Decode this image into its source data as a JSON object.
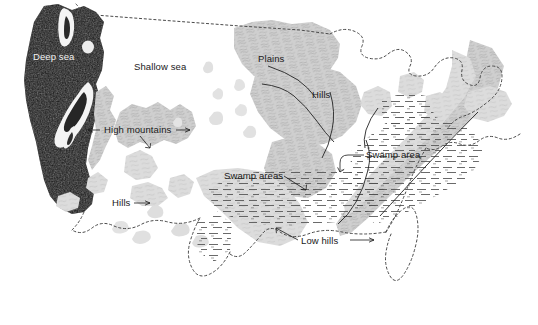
{
  "map": {
    "title": "Paleogeographic map of the United States",
    "width": 538,
    "height": 325,
    "background_color": "#ffffff",
    "colors": {
      "deep_sea": "#161616",
      "land_gray": "#c4c4c4",
      "land_gray_light": "#d8d8d8",
      "border_dotted": "#4a4a4a",
      "label_dark": "#1a1a1a",
      "label_light": "#f2f2f2",
      "swamp_dash": "#555555",
      "trendline": "#222222"
    },
    "labels": [
      {
        "id": "deep-sea",
        "text": "Deep sea",
        "x": 33,
        "y": 60,
        "style": "light",
        "anchor": "start"
      },
      {
        "id": "shallow-sea",
        "text": "Shallow sea",
        "x": 134,
        "y": 70,
        "style": "dark",
        "anchor": "start"
      },
      {
        "id": "plains",
        "text": "Plains",
        "x": 258,
        "y": 62,
        "style": "dark",
        "anchor": "start"
      },
      {
        "id": "hills-midwest",
        "text": "Hills",
        "x": 312,
        "y": 98,
        "style": "dark",
        "anchor": "start"
      },
      {
        "id": "high-mountains",
        "text": "High mountains",
        "x": 104,
        "y": 133,
        "style": "dark",
        "anchor": "start"
      },
      {
        "id": "swamp-area",
        "text": "Swamp area",
        "x": 366,
        "y": 158,
        "style": "dark",
        "anchor": "start"
      },
      {
        "id": "swamp-areas",
        "text": "Swamp areas",
        "x": 224,
        "y": 179,
        "style": "dark",
        "anchor": "start"
      },
      {
        "id": "hills-west",
        "text": "Hills",
        "x": 112,
        "y": 206,
        "style": "dark",
        "anchor": "start"
      },
      {
        "id": "low-hills",
        "text": "Low hills",
        "x": 301,
        "y": 244,
        "style": "dark",
        "anchor": "start"
      }
    ],
    "legend_semantics": [
      {
        "feature": "deep-sea",
        "symbol": "solid-dark-fill",
        "description": "Deep sea"
      },
      {
        "feature": "shallow-sea",
        "symbol": "blank-white",
        "description": "Shallow sea"
      },
      {
        "feature": "mountains",
        "symbol": "gray-hachure-texture",
        "description": "High mountains"
      },
      {
        "feature": "hills",
        "symbol": "gray-hachure-texture",
        "description": "Hills / Low hills"
      },
      {
        "feature": "plains",
        "symbol": "gray-hachure-texture",
        "description": "Plains"
      },
      {
        "feature": "swamp",
        "symbol": "horizontal-dash-rows",
        "description": "Swamp areas"
      },
      {
        "feature": "modern-border",
        "symbol": "dotted-outline",
        "description": "Present-day United States outline"
      }
    ]
  }
}
